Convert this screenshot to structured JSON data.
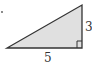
{
  "diagram": {
    "type": "right-triangle",
    "fill_color": "#e0e0e0",
    "stroke_color": "#333333",
    "labels": {
      "base": "5",
      "height": "3"
    },
    "right_angle_marker": "bottom-right"
  }
}
